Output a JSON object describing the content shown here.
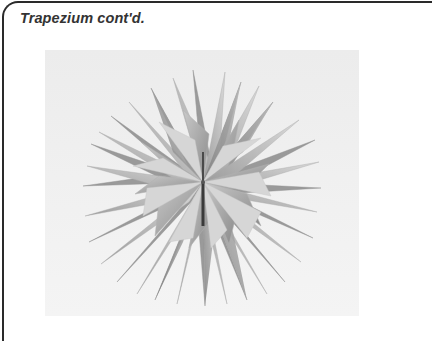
{
  "page": {
    "title": "Trapezium cont'd."
  },
  "figure": {
    "background_color": "#eeeeee",
    "frame_color": "#2a2a2a"
  }
}
